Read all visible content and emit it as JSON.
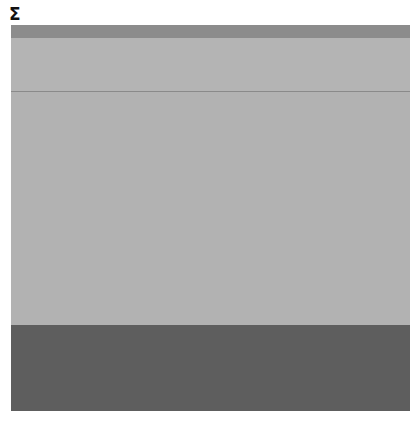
{
  "header": {
    "symbol": "Σ"
  },
  "colors": {
    "top_bar": "#8c8c8c",
    "upper": "#b4b4b4",
    "divider": "#8a8a8a",
    "middle": "#b2b2b2",
    "bottom": "#5e5e5e"
  }
}
